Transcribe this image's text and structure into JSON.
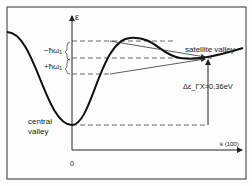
{
  "diagram": {
    "axis_y_label": "ε",
    "axis_x_label": "k (100)",
    "origin_label": "0",
    "central_valley_label": [
      "central",
      "valley"
    ],
    "satellite_valley_label": "satellite valley",
    "phonon_emission_label": "−ħω₁",
    "phonon_absorption_label": "+ħω₁",
    "energy_gap_label": "Δε_ΓX=0.36eV",
    "energy_gap_value": "0.36 eV"
  }
}
